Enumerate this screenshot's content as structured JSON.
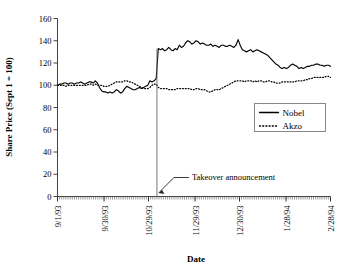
{
  "chart_data": {
    "type": "line",
    "title": "",
    "xlabel": "Date",
    "ylabel": "Share Price (Sept 1 = 100)",
    "ylim": [
      0,
      160
    ],
    "yticks": [
      0,
      20,
      40,
      60,
      80,
      100,
      120,
      140,
      160
    ],
    "xticks": [
      "9/1/93",
      "9/30/93",
      "10/29/93",
      "11/29/93",
      "12/30/93",
      "1/28/94",
      "2/28/94"
    ],
    "grid": false,
    "legend_position": "right-middle",
    "legend": [
      "Nobel",
      "Akzo"
    ],
    "annotations": [
      {
        "text": "Takeover announcement",
        "kind": "arrow-to-vertical-line",
        "x_index": 47,
        "note": "vertical rule marks the takeover announcement date"
      }
    ],
    "x_index_count": 130,
    "series": [
      {
        "name": "Nobel",
        "style": "solid",
        "color": "#000000",
        "values": [
          100,
          101,
          101,
          102,
          102,
          101,
          102,
          102,
          101,
          102,
          102,
          103,
          102,
          101,
          102,
          103,
          103,
          102,
          104,
          102,
          98,
          95,
          94,
          94,
          93,
          94,
          93,
          94,
          96,
          95,
          93,
          94,
          97,
          99,
          98,
          97,
          96,
          96,
          97,
          98,
          97,
          98,
          99,
          100,
          104,
          103,
          104,
          106,
          133,
          132,
          133,
          131,
          132,
          134,
          132,
          131,
          133,
          132,
          136,
          134,
          135,
          138,
          140,
          139,
          137,
          138,
          140,
          139,
          137,
          138,
          137,
          136,
          136,
          137,
          135,
          136,
          135,
          134,
          136,
          136,
          135,
          135,
          136,
          135,
          134,
          136,
          141,
          136,
          132,
          131,
          130,
          131,
          132,
          130,
          131,
          132,
          131,
          130,
          129,
          128,
          127,
          125,
          123,
          121,
          119,
          118,
          116,
          115,
          116,
          115,
          116,
          118,
          119,
          118,
          117,
          115,
          116,
          115,
          116,
          117,
          117,
          118,
          118,
          119,
          119,
          118,
          118,
          117,
          118,
          118,
          117
        ]
      },
      {
        "name": "Akzo",
        "style": "dotted",
        "color": "#000000",
        "values": [
          100,
          100,
          100,
          100,
          99,
          100,
          100,
          100,
          100,
          100,
          100,
          100,
          100,
          100,
          100,
          101,
          101,
          100,
          101,
          100,
          100,
          100,
          99,
          99,
          99,
          100,
          101,
          102,
          103,
          103,
          103,
          103,
          104,
          104,
          103,
          103,
          102,
          101,
          100,
          99,
          98,
          97,
          97,
          97,
          98,
          100,
          101,
          101,
          98,
          97,
          97,
          97,
          97,
          96,
          96,
          96,
          96,
          97,
          97,
          97,
          97,
          97,
          97,
          97,
          96,
          96,
          97,
          97,
          96,
          96,
          96,
          95,
          94,
          94,
          95,
          96,
          96,
          96,
          97,
          98,
          99,
          100,
          101,
          102,
          103,
          104,
          104,
          104,
          104,
          103,
          104,
          104,
          104,
          103,
          104,
          103,
          104,
          104,
          103,
          103,
          104,
          104,
          103,
          103,
          102,
          102,
          102,
          103,
          103,
          103,
          103,
          103,
          103,
          103,
          104,
          104,
          104,
          104,
          105,
          105,
          106,
          106,
          107,
          107,
          107,
          107,
          107,
          107,
          108,
          108,
          107
        ]
      }
    ]
  }
}
